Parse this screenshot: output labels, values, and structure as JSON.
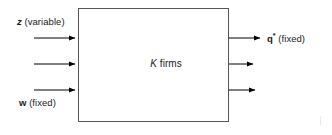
{
  "diagram": {
    "box": {
      "label_prefix": "K",
      "label_suffix": " firms",
      "x": 78,
      "y": 8,
      "width": 151,
      "height": 114,
      "stroke": "#000000",
      "stroke_width": 1,
      "fill": "#ffffff"
    },
    "inputs": {
      "top_label_symbol": "z",
      "top_label_text": " (variable)",
      "bottom_label_symbol": "w",
      "bottom_label_text": " (fixed)",
      "arrows": [
        {
          "name": "input-arrow-1",
          "x1": 34,
          "y1": 38,
          "x2": 78,
          "y2": 38
        },
        {
          "name": "input-arrow-2",
          "x1": 34,
          "y1": 64,
          "x2": 78,
          "y2": 64
        },
        {
          "name": "input-arrow-3",
          "x1": 34,
          "y1": 90,
          "x2": 78,
          "y2": 90
        }
      ]
    },
    "outputs": {
      "label_symbol": "q",
      "label_superscript": "*",
      "label_text": " (fixed)",
      "arrows": [
        {
          "name": "output-arrow-1",
          "x1": 229,
          "y1": 38,
          "x2": 263,
          "y2": 38
        },
        {
          "name": "output-arrow-2",
          "x1": 229,
          "y1": 64,
          "x2": 256,
          "y2": 64
        },
        {
          "name": "output-arrow-3",
          "x1": 229,
          "y1": 90,
          "x2": 258,
          "y2": 90
        }
      ]
    },
    "colors": {
      "ink": "#000000",
      "text": "#1a1a1a",
      "background": "#ffffff"
    }
  }
}
